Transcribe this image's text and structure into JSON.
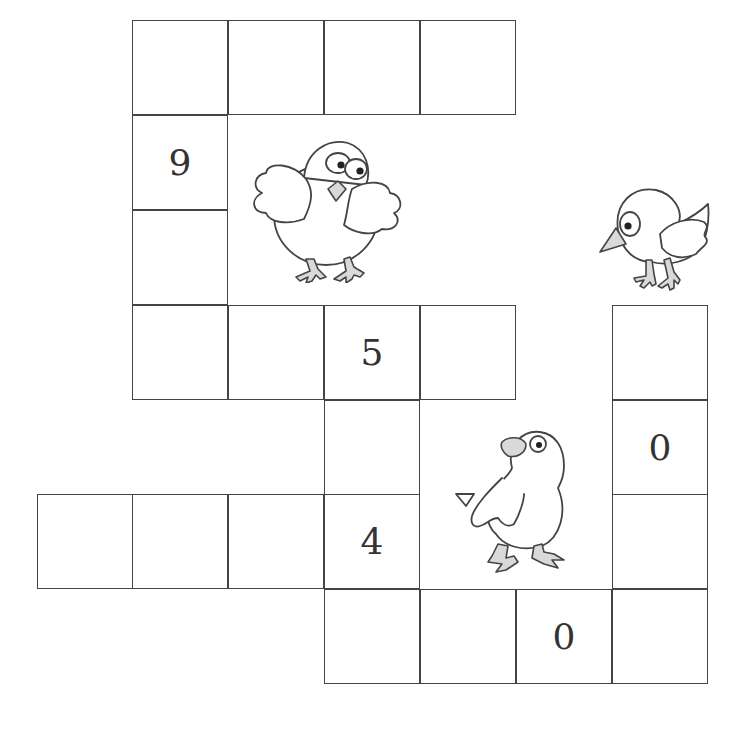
{
  "puzzle": {
    "cell_size": 96,
    "grid_origin": {
      "x": 37,
      "y": 20
    },
    "cells": [
      {
        "row": 0,
        "col": 1,
        "value": ""
      },
      {
        "row": 0,
        "col": 2,
        "value": ""
      },
      {
        "row": 0,
        "col": 3,
        "value": ""
      },
      {
        "row": 0,
        "col": 4,
        "value": ""
      },
      {
        "row": 1,
        "col": 1,
        "value": "9"
      },
      {
        "row": 2,
        "col": 1,
        "value": ""
      },
      {
        "row": 3,
        "col": 1,
        "value": ""
      },
      {
        "row": 3,
        "col": 2,
        "value": ""
      },
      {
        "row": 3,
        "col": 3,
        "value": "5"
      },
      {
        "row": 3,
        "col": 4,
        "value": ""
      },
      {
        "row": 3,
        "col": 6,
        "value": ""
      },
      {
        "row": 4,
        "col": 3,
        "value": ""
      },
      {
        "row": 4,
        "col": 6,
        "value": "0"
      },
      {
        "row": 5,
        "col": 0,
        "value": ""
      },
      {
        "row": 5,
        "col": 1,
        "value": ""
      },
      {
        "row": 5,
        "col": 2,
        "value": ""
      },
      {
        "row": 5,
        "col": 3,
        "value": "4"
      },
      {
        "row": 5,
        "col": 6,
        "value": ""
      },
      {
        "row": 6,
        "col": 3,
        "value": ""
      },
      {
        "row": 6,
        "col": 4,
        "value": ""
      },
      {
        "row": 6,
        "col": 5,
        "value": "0"
      },
      {
        "row": 6,
        "col": 6,
        "value": ""
      }
    ],
    "illustrations": [
      {
        "name": "chick-wings-spread-icon",
        "x": 250,
        "y": 135
      },
      {
        "name": "bird-pecking-icon",
        "x": 578,
        "y": 182
      },
      {
        "name": "chick-looking-up-icon",
        "x": 452,
        "y": 428
      }
    ]
  }
}
